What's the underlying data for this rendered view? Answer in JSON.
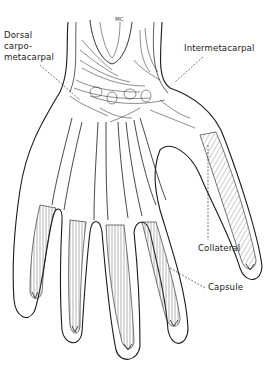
{
  "figure": {
    "colors": {
      "ink": "#1a1a1a",
      "background": "#ffffff",
      "hatch": "#555555"
    },
    "labels": {
      "mc": "MC",
      "dorsal_line1": "Dorsal",
      "dorsal_line2": "carpo-",
      "dorsal_line3": "metacarpal",
      "intermetacarpal": "Intermetacarpal",
      "collateral": "Collateral",
      "capsule": "Capsule"
    }
  }
}
